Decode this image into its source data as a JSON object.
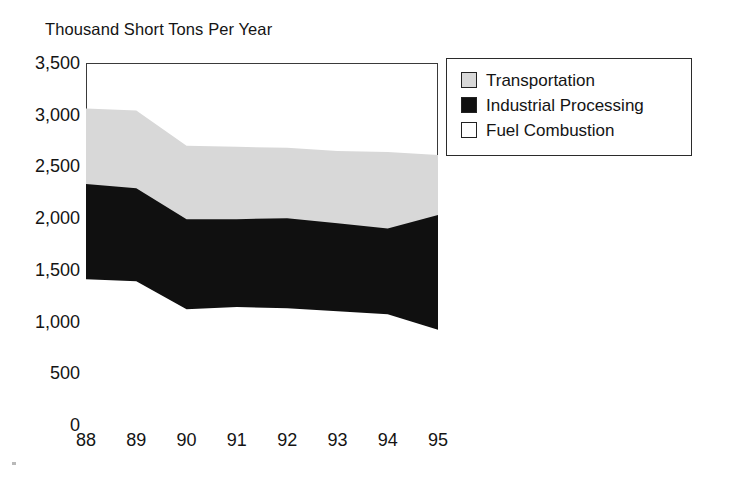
{
  "chart_data": {
    "type": "area",
    "title": "",
    "ylabel": "Thousand Short Tons Per Year",
    "xlabel": "",
    "categories": [
      "88",
      "89",
      "90",
      "91",
      "92",
      "93",
      "94",
      "95"
    ],
    "x": [
      88,
      89,
      90,
      91,
      92,
      93,
      94,
      95
    ],
    "ylim": [
      0,
      3500
    ],
    "ytick_values": [
      0,
      500,
      1000,
      1500,
      2000,
      2500,
      3000,
      3500
    ],
    "ytick_labels": [
      "0",
      "500",
      "1,000",
      "1,500",
      "2,000",
      "2,500",
      "3,000",
      "3,500"
    ],
    "xtick_labels": [
      "88",
      "89",
      "90",
      "91",
      "92",
      "93",
      "94",
      "95"
    ],
    "grid": false,
    "stacked": true,
    "stack_order_bottom_to_top": [
      "Fuel Combustion",
      "Industrial Processing",
      "Transportation"
    ],
    "legend_position": "right",
    "series": [
      {
        "name": "Fuel Combustion",
        "color": "#ffffff",
        "values": [
          1410,
          1390,
          1120,
          1140,
          1130,
          1100,
          1070,
          920
        ]
      },
      {
        "name": "Industrial Processing",
        "color": "#101010",
        "values": [
          920,
          900,
          870,
          850,
          870,
          850,
          830,
          1110
        ]
      },
      {
        "name": "Transportation",
        "color": "#d8d8d8",
        "values": [
          730,
          750,
          710,
          700,
          680,
          700,
          740,
          580
        ]
      }
    ],
    "cumulative_tops": {
      "Fuel Combustion": [
        1410,
        1390,
        1120,
        1140,
        1130,
        1100,
        1070,
        920
      ],
      "Industrial Processing": [
        2330,
        2290,
        1990,
        1990,
        2000,
        1950,
        1900,
        2030
      ],
      "Transportation": [
        3060,
        3040,
        2700,
        2690,
        2680,
        2650,
        2640,
        2610
      ]
    }
  },
  "legend": {
    "items": [
      {
        "label": "Transportation",
        "color": "#d8d8d8"
      },
      {
        "label": "Industrial Processing",
        "color": "#101010"
      },
      {
        "label": "Fuel Combustion",
        "color": "#ffffff"
      }
    ]
  },
  "axis": {
    "y_title": "Thousand Short Tons Per Year"
  }
}
